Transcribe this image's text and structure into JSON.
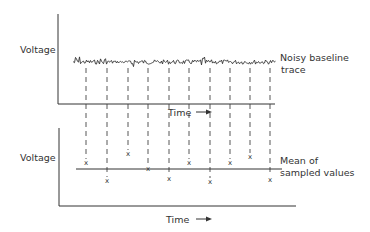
{
  "top_panel": {
    "y_label": "Voltage",
    "x_label": "Time",
    "trace_label_line1": "Noisy baseline",
    "trace_label_line2": "trace"
  },
  "bottom_panel": {
    "y_label": "Voltage",
    "x_label": "Time",
    "mean_label_line1": "Mean of",
    "mean_label_line2": "sampled values"
  },
  "sampling": {
    "sample_x_positions": [
      86,
      107,
      128,
      148,
      169,
      189,
      210,
      230,
      250,
      270
    ],
    "sample_y_positions": [
      162,
      180,
      153,
      168,
      178,
      162,
      181,
      162,
      156,
      179
    ],
    "mean_y": 169
  },
  "colors": {
    "ink": "#333333",
    "background": "#ffffff"
  }
}
